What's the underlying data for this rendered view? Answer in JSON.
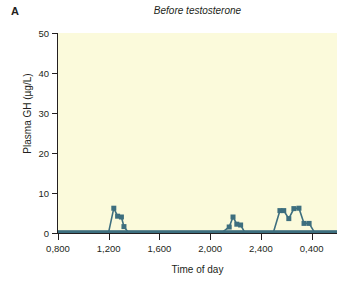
{
  "figure": {
    "panel_label": "A",
    "background_color": "#ffffff"
  },
  "chart_data": {
    "type": "line",
    "title": "Before testosterone",
    "xlabel": "Time of day",
    "ylabel": "Plasma GH (µg/L)",
    "ylim": [
      0,
      50
    ],
    "yticks": [
      0,
      10,
      20,
      30,
      40,
      50
    ],
    "ytick_labels": [
      "0",
      "10",
      "20",
      "30",
      "40",
      "50"
    ],
    "xlim": [
      800,
      3000
    ],
    "xticks": [
      800,
      1200,
      1600,
      2000,
      2400,
      2800,
      3200
    ],
    "xtick_labels": [
      "0,800",
      "1,200",
      "1,600",
      "2,000",
      "2,400",
      "0,400",
      "0,800"
    ],
    "grid": false,
    "legend": null,
    "plot_bgcolor": "#fbfadb",
    "line_color": "#3d6e7e",
    "marker": "square",
    "marker_size": 5,
    "series": [
      {
        "name": "Plasma GH",
        "x": [
          800,
          850,
          900,
          950,
          1000,
          1050,
          1100,
          1150,
          1200,
          1240,
          1270,
          1300,
          1320,
          1350,
          1400,
          1450,
          1500,
          1550,
          1600,
          1650,
          1700,
          1750,
          1800,
          1850,
          1900,
          1950,
          2000,
          2050,
          2100,
          2150,
          2180,
          2210,
          2240,
          2270,
          2300,
          2350,
          2400,
          2450,
          2500,
          2550,
          2580,
          2620,
          2660,
          2700,
          2740,
          2780,
          2820,
          2860,
          2900,
          2950,
          3000
        ],
        "y": [
          0.3,
          0.3,
          0.3,
          0.3,
          0.3,
          0.3,
          0.3,
          0.3,
          0.3,
          6.2,
          4.2,
          4.0,
          1.6,
          0.3,
          0.3,
          0.3,
          0.3,
          0.3,
          0.3,
          0.3,
          0.3,
          0.3,
          0.3,
          0.3,
          0.3,
          0.3,
          0.3,
          0.3,
          0.3,
          1.5,
          4.0,
          2.2,
          2.0,
          0.3,
          0.3,
          0.3,
          0.3,
          0.3,
          0.3,
          5.6,
          5.6,
          3.6,
          6.1,
          6.2,
          2.4,
          2.4,
          0.3,
          0.3,
          0.3,
          0.3,
          0.3
        ]
      }
    ]
  }
}
